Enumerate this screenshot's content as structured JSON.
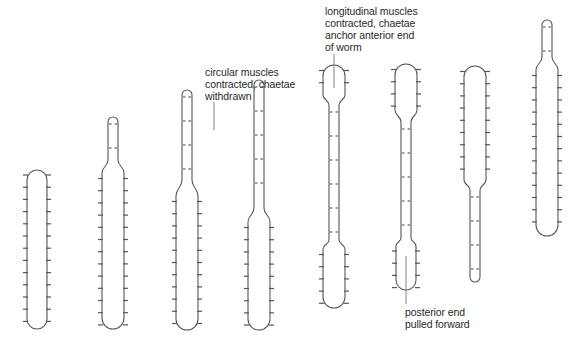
{
  "diagram": {
    "stroke_color": "#555555",
    "background": "#ffffff",
    "annotations": [
      {
        "id": "circular-muscles-label",
        "lines": [
          "circular muscles",
          "contracted, chaetae",
          "withdrawn"
        ],
        "x": 205,
        "y": 66,
        "leader": {
          "x": 214,
          "y1": 102,
          "y2": 130
        }
      },
      {
        "id": "longitudinal-muscles-label",
        "lines": [
          "longitudinal muscles",
          "contracted, chaetae",
          "anchor anterior end",
          "of worm"
        ],
        "x": 325,
        "y": 5,
        "leader": {
          "x": 334,
          "y1": 54,
          "y2": 88
        }
      },
      {
        "id": "posterior-end-label",
        "lines": [
          "posterior end",
          "pulled forward"
        ],
        "x": 405,
        "y": 306,
        "leader": {
          "x": 406,
          "y1": 256,
          "y2": 304
        }
      }
    ],
    "worms": [
      {
        "id": "worm-1",
        "stage": 1,
        "cx": 37,
        "segments": [
          {
            "top": 170,
            "bottom": 329,
            "width": 20,
            "chaetae": true
          }
        ]
      },
      {
        "id": "worm-2",
        "stage": 2,
        "cx": 113,
        "segments": [
          {
            "top": 117,
            "bottom": 160,
            "width": 10,
            "chaetae": false
          },
          {
            "top": 173,
            "bottom": 329,
            "width": 22,
            "chaetae": true
          }
        ]
      },
      {
        "id": "worm-3",
        "stage": 3,
        "cx": 187,
        "segments": [
          {
            "top": 90,
            "bottom": 180,
            "width": 10,
            "chaetae": false
          },
          {
            "top": 196,
            "bottom": 330,
            "width": 22,
            "chaetae": true
          }
        ]
      },
      {
        "id": "worm-4",
        "stage": 4,
        "cx": 259,
        "segments": [
          {
            "top": 80,
            "bottom": 208,
            "width": 10,
            "chaetae": false
          },
          {
            "top": 222,
            "bottom": 330,
            "width": 22,
            "chaetae": true
          }
        ]
      },
      {
        "id": "worm-5",
        "stage": 5,
        "cx": 334,
        "segments": [
          {
            "top": 65,
            "bottom": 95,
            "width": 22,
            "chaetae": true
          },
          {
            "top": 105,
            "bottom": 240,
            "width": 10,
            "chaetae": false
          },
          {
            "top": 249,
            "bottom": 308,
            "width": 22,
            "chaetae": true
          }
        ]
      },
      {
        "id": "worm-6",
        "stage": 6,
        "cx": 406,
        "segments": [
          {
            "top": 64,
            "bottom": 110,
            "width": 22,
            "chaetae": true
          },
          {
            "top": 122,
            "bottom": 238,
            "width": 10,
            "chaetae": false
          },
          {
            "top": 246,
            "bottom": 290,
            "width": 20,
            "chaetae": true
          }
        ]
      },
      {
        "id": "worm-7",
        "stage": 7,
        "cx": 475,
        "segments": [
          {
            "top": 66,
            "bottom": 180,
            "width": 22,
            "chaetae": true
          },
          {
            "top": 190,
            "bottom": 282,
            "width": 10,
            "chaetae": false
          }
        ]
      },
      {
        "id": "worm-8",
        "stage": 8,
        "cx": 547,
        "segments": [
          {
            "top": 20,
            "bottom": 57,
            "width": 10,
            "chaetae": false
          },
          {
            "top": 70,
            "bottom": 236,
            "width": 22,
            "chaetae": true
          }
        ]
      }
    ]
  }
}
